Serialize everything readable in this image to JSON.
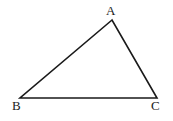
{
  "figure": {
    "kind": "geometry-diagram",
    "shape": "triangle",
    "background_color": "#ffffff",
    "stroke_color": "#1a1a1a",
    "stroke_width": 1.6,
    "label_color": "#1a1a1a"
  },
  "vertices": [
    {
      "name": "A",
      "label": "A",
      "x": 112,
      "y": 20,
      "label_x": 106,
      "label_y": 4
    },
    {
      "name": "B",
      "label": "B",
      "x": 20,
      "y": 98,
      "label_x": 12,
      "label_y": 99
    },
    {
      "name": "C",
      "label": "C",
      "x": 157,
      "y": 98,
      "label_x": 151,
      "label_y": 99
    }
  ],
  "edges": [
    {
      "name": "edge-AB",
      "from": "A",
      "to": "B"
    },
    {
      "name": "edge-AC",
      "from": "A",
      "to": "C"
    },
    {
      "name": "edge-BC",
      "from": "B",
      "to": "C"
    }
  ],
  "path": "M 112 20 L 20 98 L 157 98 Z"
}
